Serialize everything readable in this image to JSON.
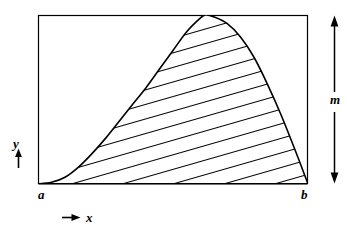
{
  "figure": {
    "type": "hatched-area-under-curve-diagram",
    "background_color": "#ffffff",
    "ink_color": "#000000"
  },
  "labels": {
    "x_axis": "x",
    "y_axis": "y",
    "left_bound": "a",
    "right_bound": "b",
    "height_measure": "m"
  },
  "icons": {
    "y_arrow": "arrow-up-icon",
    "x_arrow": "arrow-right-icon",
    "m_arrow": "arrow-up-down-icon"
  },
  "chart_data": {
    "type": "area",
    "title": "",
    "xlabel": "x",
    "ylabel": "y",
    "grid": false,
    "legend": null,
    "annotations": [
      {
        "text": "a",
        "role": "lower-x-bound",
        "x": 0.0
      },
      {
        "text": "b",
        "role": "upper-x-bound",
        "x": 1.0
      },
      {
        "text": "m",
        "role": "vertical-extent-marker",
        "position": "right-of-plot"
      }
    ],
    "axis_box": {
      "x0": 38,
      "y0": 15,
      "x1": 308,
      "y1": 184
    },
    "xlim": [
      0,
      1
    ],
    "ylim": [
      0,
      1
    ],
    "fill": "diagonal-hatch",
    "hatch_angle_deg": 15,
    "hatch_spacing_px": 3.6,
    "series": [
      {
        "name": "f(x)",
        "x": [
          0.0,
          0.05,
          0.1,
          0.15,
          0.2,
          0.25,
          0.3,
          0.35,
          0.4,
          0.45,
          0.5,
          0.55,
          0.6,
          0.62,
          0.65,
          0.7,
          0.75,
          0.8,
          0.85,
          0.9,
          0.95,
          1.0
        ],
        "y": [
          0.0,
          0.01,
          0.04,
          0.1,
          0.18,
          0.27,
          0.37,
          0.47,
          0.57,
          0.68,
          0.79,
          0.9,
          0.98,
          1.0,
          0.99,
          0.95,
          0.87,
          0.75,
          0.59,
          0.41,
          0.21,
          0.0
        ]
      }
    ]
  }
}
